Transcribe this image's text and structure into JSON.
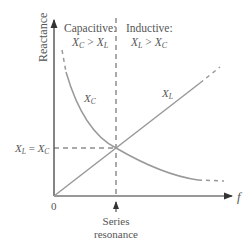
{
  "diagram": {
    "y_axis_label": "Reactance",
    "x_axis_label": "f",
    "origin_label": "0",
    "regions": {
      "capacitive": {
        "title": "Capacitive:",
        "cond_a": "X",
        "cond_a_sub": "C",
        "op": " > ",
        "cond_b": "X",
        "cond_b_sub": "L"
      },
      "inductive": {
        "title": "Inductive:",
        "cond_a": "X",
        "cond_a_sub": "L",
        "op": " > ",
        "cond_b": "X",
        "cond_b_sub": "C"
      }
    },
    "curves": {
      "xc": {
        "label": "X",
        "sub": "C"
      },
      "xl": {
        "label": "X",
        "sub": "L"
      }
    },
    "equality_label": {
      "a": "X",
      "a_sub": "L",
      "eq": " = ",
      "b": "X",
      "b_sub": "C"
    },
    "resonance_label": {
      "line1": "Series",
      "line2": "resonance"
    },
    "colors": {
      "axis": "#333333",
      "curve": "#999999",
      "dash": "#555555",
      "text": "#555555"
    }
  }
}
